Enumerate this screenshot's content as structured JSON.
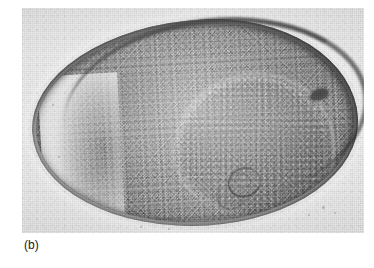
{
  "figure": {
    "caption_label": "(b)",
    "panel_letter": "b",
    "kind": "transmission-electron-micrograph",
    "background_color": "#ffffff",
    "plate_color": "#e9e9e9"
  },
  "micrograph": {
    "alt_text": "Transmission electron micrograph of a thin-sectioned bacterial cell showing a dense granular cytoplasm enclosed by a thick electron-dense cell envelope, with a lighter-rimmed internal nucleoid region, a small dark ring-shaped mesosome near the centre and an electron-dense granule at the upper right.",
    "structures": [
      {
        "name": "cell-envelope",
        "label": "cell envelope",
        "tone": "electron-dense",
        "color": "#0b0b0b"
      },
      {
        "name": "cytoplasm",
        "label": "granular cytoplasm",
        "tone": "medium-dense",
        "color": "#7e7e7e"
      },
      {
        "name": "nucleoid",
        "label": "nucleoid region",
        "tone": "light-rimmed",
        "color": "#9a9a9a"
      },
      {
        "name": "mesosome",
        "label": "mesosome / membrane whorl",
        "tone": "dark ring",
        "color": "#121212"
      },
      {
        "name": "dense-granule",
        "label": "electron-dense granule",
        "tone": "very dark",
        "color": "#050505"
      },
      {
        "name": "background",
        "label": "embedding resin background",
        "tone": "light",
        "color": "#e9e9e9"
      }
    ],
    "specks": [
      {
        "left": 300,
        "top": 198,
        "size": 3
      },
      {
        "left": 312,
        "top": 204,
        "size": 2
      },
      {
        "left": 286,
        "top": 206,
        "size": 2
      },
      {
        "left": 36,
        "top": 148,
        "size": 2
      },
      {
        "left": 30,
        "top": 96,
        "size": 2
      },
      {
        "left": 118,
        "top": 218,
        "size": 2
      },
      {
        "left": 146,
        "top": 220,
        "size": 2
      }
    ]
  }
}
